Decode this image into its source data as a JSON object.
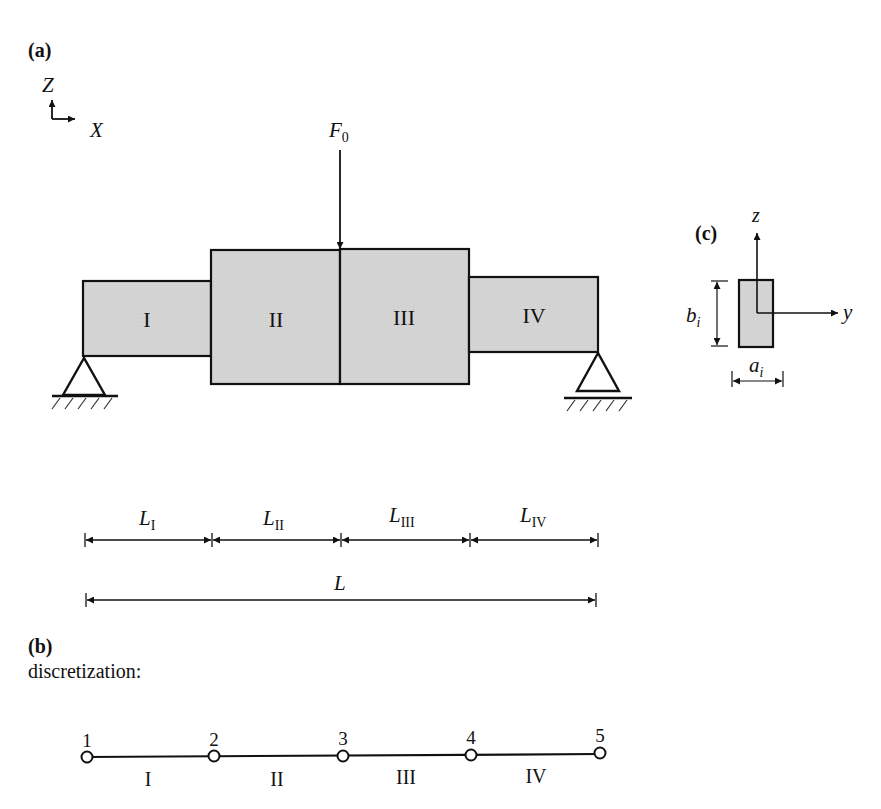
{
  "panels": {
    "a": {
      "label": "(a)"
    },
    "b": {
      "label": "(b)",
      "caption": "discretization:"
    },
    "c": {
      "label": "(c)"
    }
  },
  "global_axes": {
    "vertical": "Z",
    "horizontal": "X"
  },
  "load": {
    "symbol": "F",
    "subscript": "0"
  },
  "segments": [
    {
      "id": "I",
      "label": "I"
    },
    {
      "id": "II",
      "label": "II"
    },
    {
      "id": "III",
      "label": "III"
    },
    {
      "id": "IV",
      "label": "IV"
    }
  ],
  "dimensions": {
    "segment_lengths": [
      {
        "symbol": "L",
        "subscript": "I"
      },
      {
        "symbol": "L",
        "subscript": "II"
      },
      {
        "symbol": "L",
        "subscript": "III"
      },
      {
        "symbol": "L",
        "subscript": "IV"
      }
    ],
    "total": {
      "symbol": "L"
    }
  },
  "cross_section": {
    "axis_vertical": "z",
    "axis_horizontal": "y",
    "height": {
      "symbol": "b",
      "subscript": "i"
    },
    "width": {
      "symbol": "a",
      "subscript": "i"
    }
  },
  "discretization": {
    "nodes": [
      "1",
      "2",
      "3",
      "4",
      "5"
    ],
    "elements": [
      "I",
      "II",
      "III",
      "IV"
    ]
  },
  "colors": {
    "fill": "#d4d4d4",
    "stroke": "#111111",
    "background": "#ffffff"
  }
}
